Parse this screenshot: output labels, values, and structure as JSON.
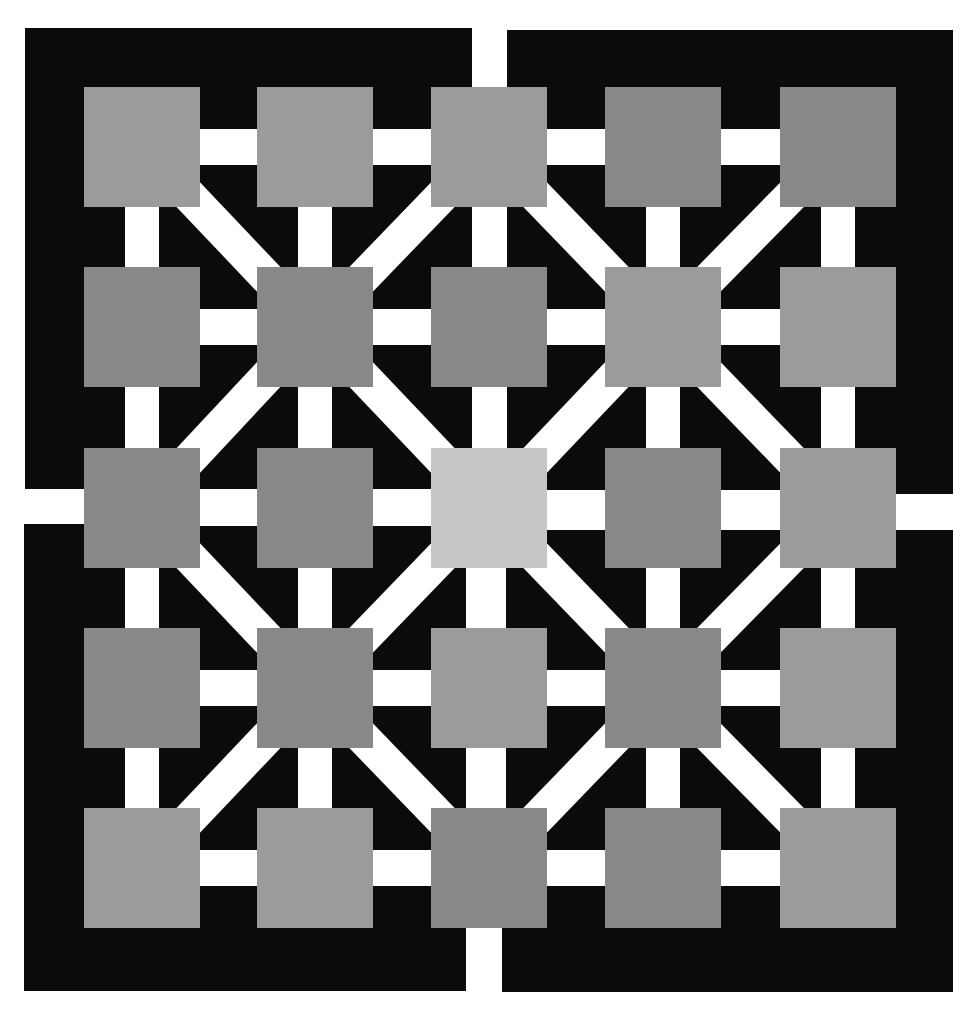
{
  "figure": {
    "background_color": "#ffffff",
    "panel_color": "#0b0b0b",
    "band_color": "#ffffff",
    "band_width": 34,
    "tones": {
      "L": "#9b9b9b",
      "D": "#888888",
      "C": "#c6c6c6"
    },
    "quadrants": [
      {
        "name": "top-left",
        "x": 25,
        "y": 28,
        "w": 447,
        "h": 461
      },
      {
        "name": "top-right",
        "x": 507,
        "y": 30,
        "w": 446,
        "h": 464
      },
      {
        "name": "bottom-left",
        "x": 24,
        "y": 524,
        "w": 442,
        "h": 467
      },
      {
        "name": "bottom-right",
        "x": 502,
        "y": 530,
        "w": 451,
        "h": 462
      }
    ],
    "grid": {
      "col_x": [
        84,
        257,
        431,
        605,
        780
      ],
      "row_y": [
        87,
        267,
        448,
        628,
        808
      ],
      "square_w": 116,
      "square_h": 120
    },
    "square_tones": [
      [
        "L",
        "L",
        "L",
        "D",
        "D"
      ],
      [
        "D",
        "D",
        "D",
        "L",
        "L"
      ],
      [
        "D",
        "D",
        "C",
        "D",
        "L"
      ],
      [
        "D",
        "D",
        "L",
        "D",
        "L"
      ],
      [
        "L",
        "L",
        "D",
        "D",
        "L"
      ]
    ]
  }
}
